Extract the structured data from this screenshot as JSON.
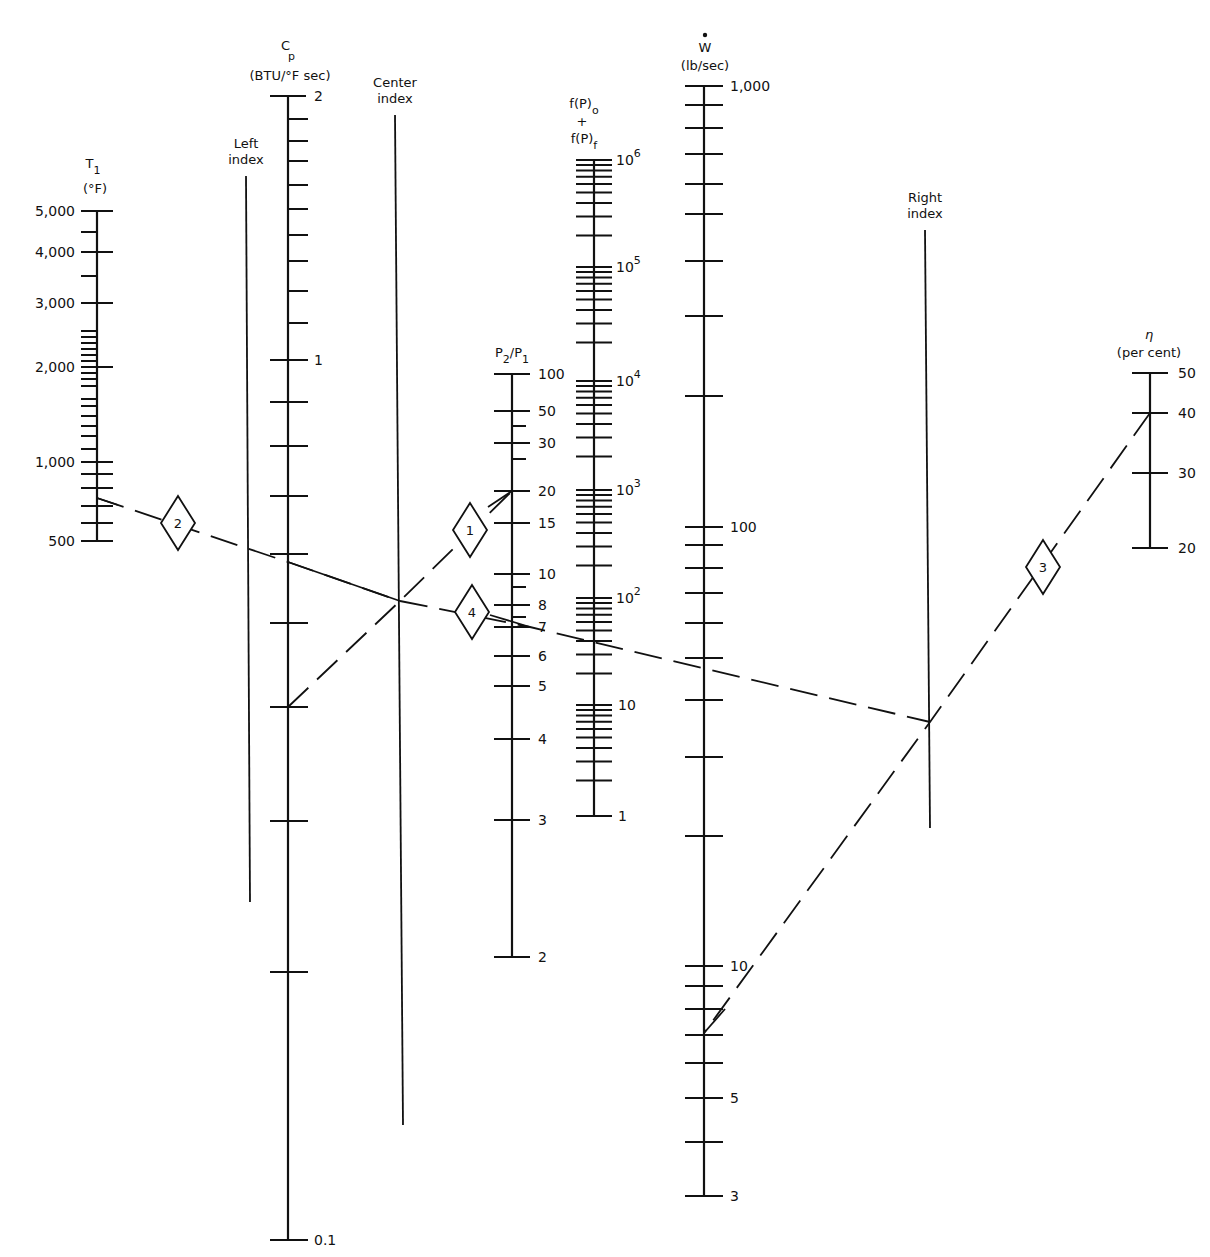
{
  "chart_data": {
    "type": "nomograph",
    "title": "",
    "scales": [
      {
        "id": "T1",
        "title": "T1",
        "unit": "(°F)",
        "x": 97,
        "y_top": 211,
        "y_bottom": 541,
        "labels": [
          {
            "text": "5,000",
            "y": 211
          },
          {
            "text": "4,000",
            "y": 252
          },
          {
            "text": "3,000",
            "y": 303
          },
          {
            "text": "2,000",
            "y": 367
          },
          {
            "text": "1,000",
            "y": 462
          },
          {
            "text": "500",
            "y": 541
          }
        ],
        "ticks_major": [
          211,
          252,
          303,
          367,
          462,
          474,
          488,
          506,
          523,
          541
        ],
        "ticks_minor": [
          232,
          276,
          331,
          337,
          343,
          349,
          355,
          361,
          373,
          379,
          386,
          399,
          406,
          416,
          426,
          436,
          449
        ],
        "label_side": "left"
      },
      {
        "id": "Cp",
        "title": "Cp",
        "unit": "(BTU/°F sec)",
        "x": 288,
        "y_top": 96,
        "y_bottom": 1240,
        "labels": [
          {
            "text": "2",
            "y": 96
          },
          {
            "text": "1",
            "y": 360
          },
          {
            "text": "0.1",
            "y": 1240
          }
        ],
        "ticks_major": [
          96,
          360,
          402,
          446,
          496,
          554,
          623,
          707,
          821,
          972,
          1240
        ],
        "ticks_minor": [
          119,
          141,
          161,
          185,
          209,
          235,
          261,
          291,
          323
        ],
        "label_side": "right"
      },
      {
        "id": "P2P1",
        "title": "P2/P1",
        "x": 512,
        "y_top": 374,
        "y_bottom": 957,
        "labels": [
          {
            "text": "100",
            "y": 374
          },
          {
            "text": "50",
            "y": 411
          },
          {
            "text": "30",
            "y": 443
          },
          {
            "text": "20",
            "y": 491
          },
          {
            "text": "15",
            "y": 523
          },
          {
            "text": "10",
            "y": 574
          },
          {
            "text": "8",
            "y": 605
          },
          {
            "text": "7",
            "y": 627
          },
          {
            "text": "6",
            "y": 656
          },
          {
            "text": "5",
            "y": 686
          },
          {
            "text": "4",
            "y": 739
          },
          {
            "text": "3",
            "y": 820
          },
          {
            "text": "2",
            "y": 957
          }
        ],
        "ticks_major": [
          374,
          411,
          443,
          491,
          523,
          574,
          605,
          627,
          656,
          686,
          739,
          820,
          957
        ],
        "ticks_minor": [
          426,
          459,
          587,
          617
        ],
        "label_side": "right"
      },
      {
        "id": "fP",
        "title": "f(P)o + f(P)f",
        "x": 594,
        "y_top": 160,
        "y_bottom": 816,
        "labels": [
          {
            "text": "10^6",
            "base": "10",
            "exp": "6",
            "y": 160
          },
          {
            "text": "10^5",
            "base": "10",
            "exp": "5",
            "y": 267
          },
          {
            "text": "10^4",
            "base": "10",
            "exp": "4",
            "y": 381
          },
          {
            "text": "10^3",
            "base": "10",
            "exp": "3",
            "y": 490
          },
          {
            "text": "10^2",
            "base": "10",
            "exp": "2",
            "y": 598
          },
          {
            "text": "10",
            "y": 705
          },
          {
            "text": "1",
            "y": 816
          }
        ],
        "decade_tick_offsets": [
          0,
          5,
          10,
          16,
          22,
          30,
          41,
          55,
          74
        ],
        "label_side": "right"
      },
      {
        "id": "W",
        "title": "Ẇ",
        "unit": "(lb/sec)",
        "x": 704,
        "y_top": 86,
        "y_bottom": 1196,
        "labels": [
          {
            "text": "1,000",
            "y": 86
          },
          {
            "text": "100",
            "y": 527
          },
          {
            "text": "10",
            "y": 966
          },
          {
            "text": "5",
            "y": 1098
          },
          {
            "text": "3",
            "y": 1196
          }
        ],
        "ticks": [
          86,
          105,
          128,
          154,
          184,
          214,
          261,
          316,
          396,
          527,
          545,
          568,
          593,
          623,
          658,
          700,
          757,
          836,
          966,
          986,
          1009,
          1035,
          1063,
          1098,
          1142,
          1196
        ],
        "label_side": "right"
      },
      {
        "id": "eta",
        "title": "η",
        "unit": "(per cent)",
        "x": 1150,
        "y_top": 373,
        "y_bottom": 548,
        "labels": [
          {
            "text": "50",
            "y": 373
          },
          {
            "text": "40",
            "y": 413
          },
          {
            "text": "30",
            "y": 473
          },
          {
            "text": "20",
            "y": 548
          }
        ],
        "ticks_major": [
          373,
          413,
          473,
          548
        ],
        "label_side": "right"
      }
    ],
    "index_lines": [
      {
        "id": "left",
        "label": [
          "Left",
          "index"
        ],
        "x1": 246,
        "y1": 176,
        "x2": 250,
        "y2": 902
      },
      {
        "id": "center",
        "label": [
          "Center",
          "index"
        ],
        "x1": 395,
        "y1": 115,
        "x2": 403,
        "y2": 1125
      },
      {
        "id": "right",
        "label": [
          "Right",
          "index"
        ],
        "x1": 925,
        "y1": 230,
        "x2": 930,
        "y2": 828
      }
    ],
    "solution_lines": [
      {
        "step": "1",
        "from": "Cp ≈ 0.5",
        "to": "P2/P1 = 20",
        "points": [
          [
            288,
            707
          ],
          [
            400,
            601
          ],
          [
            512,
            491
          ]
        ],
        "diamond": [
          470,
          530
        ]
      },
      {
        "step": "2",
        "from": "T1 ≈ 700 °F",
        "to": "Cp ≈ 0.7 → center index",
        "points": [
          [
            97,
            498
          ],
          [
            288,
            562
          ],
          [
            400,
            601
          ]
        ],
        "diamond": [
          178,
          523
        ]
      },
      {
        "step": "4",
        "from": "center index",
        "to": "P2/P1 = 7 → right index",
        "points": [
          [
            400,
            601
          ],
          [
            530,
            627
          ],
          [
            930,
            722
          ]
        ],
        "diamond": [
          472,
          612
        ]
      },
      {
        "step": "3",
        "from": "η = 40 %",
        "to": "Ẇ ≈ 7 lb/sec",
        "points": [
          [
            1150,
            413
          ],
          [
            930,
            722
          ],
          [
            704,
            1033
          ]
        ],
        "diamond": [
          1043,
          567
        ]
      }
    ]
  },
  "diagram": {
    "steps": [
      "1",
      "2",
      "3",
      "4"
    ]
  }
}
